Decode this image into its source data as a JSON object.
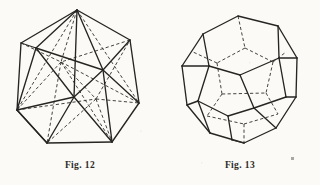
{
  "plate": {
    "background_color": "#fbfaf6",
    "ink_color": "#262523",
    "hidden_edge_color": "#3a3935",
    "figure_count": 2
  },
  "figures": [
    {
      "id": "fig-12",
      "caption": "Fig. 12",
      "solid_name": "icosahedron",
      "vertices": 12,
      "edges": 30,
      "faces": 20,
      "face_shape": "triangle",
      "line_style_visible": "solid",
      "line_style_hidden": "dashed"
    },
    {
      "id": "fig-13",
      "caption": "Fig. 13",
      "solid_name": "dodecahedron",
      "vertices": 20,
      "edges": 30,
      "faces": 12,
      "face_shape": "pentagon",
      "line_style_visible": "solid",
      "line_style_hidden": "dashed"
    }
  ],
  "artifacts": {
    "speck_label": "scan-speck"
  }
}
